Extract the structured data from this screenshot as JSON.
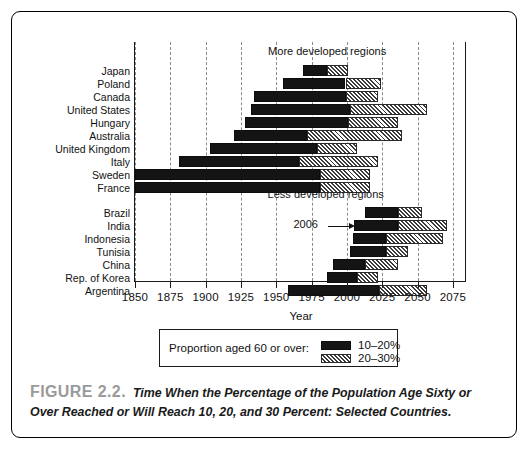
{
  "figure": {
    "number_label": "FIGURE 2.2.",
    "caption": "Time When the Percentage of the Population Age Sixty or Over Reached or Will Reach 10, 20, and 30 Percent: Selected Countries."
  },
  "legend": {
    "title": "Proportion aged 60 or over:",
    "entries": [
      {
        "swatch": "black-solid",
        "label": "10–20%"
      },
      {
        "swatch": "diagonal-hatch",
        "label": "20–30%"
      }
    ]
  },
  "annotation": {
    "label": "2006",
    "year": 2006
  },
  "chart_data": {
    "type": "bar",
    "orientation": "horizontal-range",
    "title": "",
    "xlabel": "Year",
    "ylabel": "",
    "xlim": [
      1850,
      2085
    ],
    "xticks": [
      1850,
      1875,
      1900,
      1925,
      1950,
      1975,
      2000,
      2025,
      2050,
      2075
    ],
    "xticklabels": [
      "1850",
      "1875",
      "1900",
      "1925",
      "1950",
      "1975",
      "2000",
      "2025",
      "2050",
      "2075"
    ],
    "grid": "vertical-dashed",
    "legend_position": "below-axes",
    "group_labels": [
      "More developed regions",
      "Less developed regions"
    ],
    "series": [
      {
        "name": "10–20%",
        "style": "black-solid"
      },
      {
        "name": "20–30%",
        "style": "diagonal-hatch"
      }
    ],
    "groups": [
      {
        "name": "More developed regions",
        "categories": [
          "Japan",
          "Poland",
          "Canada",
          "United States",
          "Hungary",
          "Australia",
          "United Kingdom",
          "Italy",
          "Sweden",
          "France"
        ],
        "bars": [
          {
            "category": "Japan",
            "reach10": 1969,
            "reach20": 1986,
            "reach30": 2001
          },
          {
            "category": "Poland",
            "reach10": 1955,
            "reach20": 1999,
            "reach30": 2024
          },
          {
            "category": "Canada",
            "reach10": 1934,
            "reach20": 1999,
            "reach30": 2022
          },
          {
            "category": "United States",
            "reach10": 1932,
            "reach20": 2002,
            "reach30": 2057
          },
          {
            "category": "Hungary",
            "reach10": 1928,
            "reach20": 2001,
            "reach30": 2036
          },
          {
            "category": "Australia",
            "reach10": 1920,
            "reach20": 1972,
            "reach30": 2039
          },
          {
            "category": "United Kingdom",
            "reach10": 1903,
            "reach20": 1979,
            "reach30": 2007
          },
          {
            "category": "Italy",
            "reach10": 1881,
            "reach20": 1966,
            "reach30": 2022
          },
          {
            "category": "Sweden",
            "reach10": 1850,
            "reach20": 1981,
            "reach30": 2016
          },
          {
            "category": "France",
            "reach10": 1850,
            "reach20": 1981,
            "reach30": 2016
          }
        ]
      },
      {
        "name": "Less developed regions",
        "categories": [
          "Brazil",
          "India",
          "Indonesia",
          "Tunisia",
          "China",
          "Rep. of Korea",
          "Argentina"
        ],
        "bars": [
          {
            "category": "Brazil",
            "reach10": 2013,
            "reach20": 2036,
            "reach30": 2053
          },
          {
            "category": "India",
            "reach10": 2005,
            "reach20": 2036,
            "reach30": 2071
          },
          {
            "category": "Indonesia",
            "reach10": 2004,
            "reach20": 2028,
            "reach30": 2068
          },
          {
            "category": "Tunisia",
            "reach10": 2002,
            "reach20": 2028,
            "reach30": 2043
          },
          {
            "category": "China",
            "reach10": 1990,
            "reach20": 2013,
            "reach30": 2036
          },
          {
            "category": "Rep. of Korea",
            "reach10": 1986,
            "reach20": 2007,
            "reach30": 2022
          },
          {
            "category": "Argentina",
            "reach10": 1958,
            "reach20": 2023,
            "reach30": 2057
          }
        ]
      }
    ]
  }
}
